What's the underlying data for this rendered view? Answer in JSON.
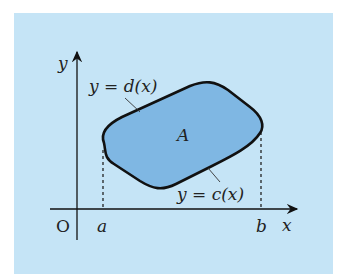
{
  "diagram": {
    "type": "region-between-curves",
    "background_color": "#c5e4f6",
    "region_fill": "#7fb7e3",
    "labels": {
      "y_axis": "y",
      "x_axis": "x",
      "origin": "O",
      "a": "a",
      "b": "b",
      "region": "A",
      "upper_curve": "y = d(x)",
      "lower_curve": "y = c(x)"
    }
  }
}
